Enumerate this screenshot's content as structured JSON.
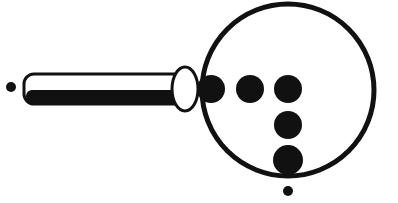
{
  "figure": {
    "colors": {
      "ink": "#111111",
      "background": "#ffffff"
    },
    "lens": {
      "cx": 288,
      "cy": 90,
      "r": 86,
      "stroke_width": 5
    },
    "handle": {
      "x": 24,
      "y": 74,
      "width": 166,
      "height": 30,
      "rx": 10
    },
    "joint": {
      "cx": 185,
      "cy": 89,
      "rx": 13,
      "ry": 22
    },
    "dots": [
      {
        "cx": 211,
        "cy": 89,
        "r": 14
      },
      {
        "cx": 250,
        "cy": 89,
        "r": 14
      },
      {
        "cx": 288,
        "cy": 89,
        "r": 14
      },
      {
        "cx": 288,
        "cy": 125,
        "r": 14
      },
      {
        "cx": 288,
        "cy": 160,
        "r": 15
      }
    ],
    "small_dots": [
      {
        "cx": 11,
        "cy": 87,
        "r": 5
      },
      {
        "cx": 288,
        "cy": 191,
        "r": 5
      }
    ]
  }
}
